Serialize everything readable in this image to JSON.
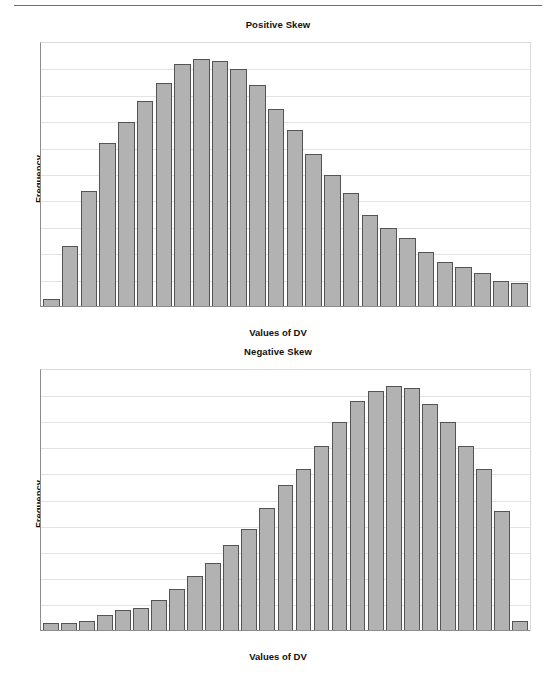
{
  "page": {
    "background": "#ffffff",
    "rule_color": "#6e6e6e"
  },
  "style": {
    "bar_fill": "#b2b2b2",
    "bar_border": "#545454",
    "gridline_color": "#e3e3e3",
    "axis_color": "#8c8c8c"
  },
  "chart_data": [
    {
      "id": "positive-skew",
      "type": "bar",
      "title": "Positive Skew",
      "xlabel": "Values of DV",
      "ylabel": "Frequency",
      "grid": true,
      "gridline_count": 9,
      "legend": null,
      "ylim": [
        0,
        100
      ],
      "categories": [
        "1",
        "2",
        "3",
        "4",
        "5",
        "6",
        "7",
        "8",
        "9",
        "10",
        "11",
        "12",
        "13",
        "14",
        "15",
        "16",
        "17",
        "18",
        "19",
        "20",
        "21",
        "22",
        "23",
        "24",
        "25",
        "26"
      ],
      "values": [
        3,
        23,
        44,
        62,
        70,
        78,
        85,
        92,
        94,
        93,
        90,
        84,
        75,
        67,
        58,
        50,
        43,
        35,
        30,
        26,
        21,
        17,
        15,
        13,
        10,
        9
      ]
    },
    {
      "id": "negative-skew",
      "type": "bar",
      "title": "Negative Skew",
      "xlabel": "Values of DV",
      "ylabel": "Frequency",
      "grid": true,
      "gridline_count": 9,
      "legend": null,
      "ylim": [
        0,
        100
      ],
      "categories": [
        "1",
        "2",
        "3",
        "4",
        "5",
        "6",
        "7",
        "8",
        "9",
        "10",
        "11",
        "12",
        "13",
        "14",
        "15",
        "16",
        "17",
        "18",
        "19",
        "20",
        "21",
        "22",
        "23",
        "24",
        "25",
        "26",
        "27"
      ],
      "values": [
        3,
        3,
        4,
        6,
        8,
        9,
        12,
        16,
        21,
        26,
        33,
        39,
        47,
        56,
        62,
        71,
        80,
        88,
        92,
        94,
        93,
        87,
        80,
        71,
        62,
        46,
        4
      ]
    }
  ]
}
